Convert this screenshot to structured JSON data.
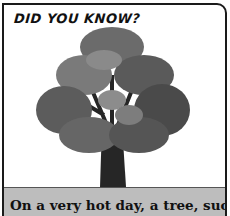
{
  "card": {
    "title": "DID YOU KNOW?",
    "caption": "On a very hot day, a tree, such",
    "illustration": "tree-illustration"
  },
  "colors": {
    "border": "#1a1a1a",
    "ground": "#bdbdbd",
    "foliage_dark": "#3a3a3a",
    "foliage_mid": "#6b6b6b",
    "foliage_light": "#8c8c8c",
    "trunk": "#2a2a2a"
  }
}
